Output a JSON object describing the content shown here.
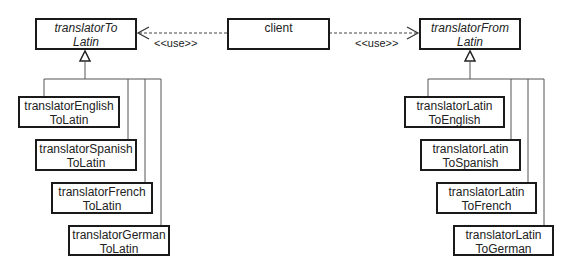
{
  "diagram": {
    "type": "UML class diagram",
    "client": {
      "label": "client"
    },
    "abstract_classes": [
      {
        "id": "toLatin",
        "lines": [
          "translatorTo",
          "Latin"
        ]
      },
      {
        "id": "fromLatin",
        "lines": [
          "translatorFrom",
          "Latin"
        ]
      }
    ],
    "relations": [
      {
        "from": "client",
        "to": "toLatin",
        "kind": "dependency",
        "label": "<<use>>"
      },
      {
        "from": "client",
        "to": "fromLatin",
        "kind": "dependency",
        "label": "<<use>>"
      }
    ],
    "toLatin_subclasses": [
      {
        "lines": [
          "translatorEnglish",
          "ToLatin"
        ]
      },
      {
        "lines": [
          "translatorSpanish",
          "ToLatin"
        ]
      },
      {
        "lines": [
          "translatorFrench",
          "ToLatin"
        ]
      },
      {
        "lines": [
          "translatorGerman",
          "ToLatin"
        ]
      }
    ],
    "fromLatin_subclasses": [
      {
        "lines": [
          "translatorLatin",
          "ToEnglish"
        ]
      },
      {
        "lines": [
          "translatorLatin",
          "ToSpanish"
        ]
      },
      {
        "lines": [
          "translatorLatin",
          "ToFrench"
        ]
      },
      {
        "lines": [
          "translatorLatin",
          "ToGerman"
        ]
      }
    ]
  }
}
